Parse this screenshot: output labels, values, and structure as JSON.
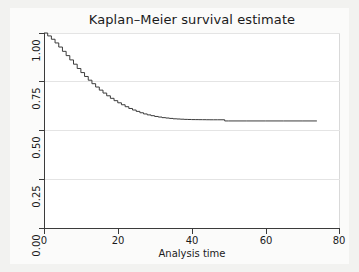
{
  "figure": {
    "background_color": "#f2f2f0",
    "plot_background_color": "#ffffff",
    "title": "Kaplan–Meier survival estimate"
  },
  "axes": {
    "x_title": "Analysis time",
    "y_title": "",
    "x_ticks": [
      "0",
      "20",
      "40",
      "60",
      "80"
    ],
    "y_ticks": [
      "0.00",
      "0.25",
      "0.50",
      "0.75",
      "1.00"
    ]
  },
  "chart_data": {
    "type": "line",
    "title": "Kaplan–Meier survival estimate",
    "subtitle": "",
    "xlabel": "Analysis time",
    "ylabel": "",
    "xlim": [
      0,
      80
    ],
    "ylim": [
      0,
      1
    ],
    "xticks": [
      0,
      20,
      40,
      60,
      80
    ],
    "yticks": [
      0.0,
      0.25,
      0.5,
      0.75,
      1.0
    ],
    "grid": true,
    "grid_axis": "y",
    "legend": "none",
    "line_color": "#3b3b3b",
    "line_width": 1,
    "series": [
      {
        "name": "Survival probability",
        "x": [
          0,
          1,
          2,
          3,
          4,
          5,
          6,
          7,
          8,
          9,
          10,
          11,
          12,
          13,
          14,
          15,
          16,
          17,
          18,
          19,
          20,
          21,
          22,
          23,
          24,
          25,
          26,
          27,
          28,
          29,
          30,
          31,
          32,
          33,
          34,
          35,
          36,
          37,
          38,
          39,
          40,
          41,
          42,
          43,
          44,
          45,
          46,
          47,
          48,
          49,
          50,
          55,
          60,
          65,
          70,
          74
        ],
        "y": [
          1.0,
          0.985,
          0.968,
          0.949,
          0.928,
          0.906,
          0.884,
          0.862,
          0.84,
          0.818,
          0.797,
          0.777,
          0.758,
          0.74,
          0.723,
          0.707,
          0.692,
          0.678,
          0.665,
          0.653,
          0.642,
          0.632,
          0.622,
          0.613,
          0.605,
          0.598,
          0.591,
          0.585,
          0.58,
          0.576,
          0.572,
          0.569,
          0.566,
          0.564,
          0.562,
          0.56,
          0.559,
          0.558,
          0.557,
          0.5565,
          0.556,
          0.5558,
          0.5556,
          0.5554,
          0.5552,
          0.555,
          0.555,
          0.555,
          0.555,
          0.549,
          0.549,
          0.549,
          0.549,
          0.549,
          0.549,
          0.549
        ]
      }
    ],
    "annotations": [
      {
        "text": "curve starts at survival = 1.00 at time 0",
        "visible": false
      },
      {
        "text": "curve plateaus near 0.55 after time 40",
        "visible": false
      },
      {
        "text": "small step down near time 49",
        "visible": false
      },
      {
        "text": "curve ends near time 74",
        "visible": false
      }
    ]
  }
}
